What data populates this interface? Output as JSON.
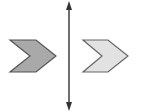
{
  "diagram": {
    "line_of_reflection": {
      "orientation": "vertical",
      "arrowheads": "both-ends",
      "color": "#333333"
    },
    "shapes": [
      {
        "id": "preimage",
        "shape": "chevron",
        "direction": "right",
        "fill": "#a9a9a9",
        "stroke": "#555555"
      },
      {
        "id": "image",
        "shape": "chevron",
        "direction": "right",
        "fill": "#e2e2e2",
        "stroke": "#666666"
      }
    ],
    "background": "#ffffff"
  }
}
